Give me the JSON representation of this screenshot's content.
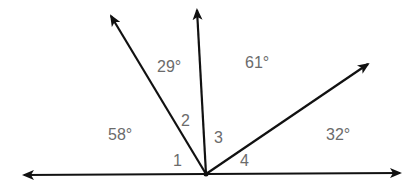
{
  "diagram": {
    "type": "angles-on-a-line",
    "vertex": {
      "x": 206,
      "y": 174
    },
    "rays": [
      {
        "name": "left-ray",
        "tip": {
          "x": 22,
          "y": 175
        }
      },
      {
        "name": "right-ray",
        "tip": {
          "x": 402,
          "y": 173
        }
      },
      {
        "name": "upper-left-ray",
        "tip": {
          "x": 110,
          "y": 14
        }
      },
      {
        "name": "vertical-ray",
        "tip": {
          "x": 197,
          "y": 8
        }
      },
      {
        "name": "upper-right-ray",
        "tip": {
          "x": 370,
          "y": 63
        }
      }
    ],
    "labels": {
      "deg_58": "58°",
      "deg_29": "29°",
      "deg_61": "61°",
      "deg_32": "32°",
      "angle_1": "1",
      "angle_2": "2",
      "angle_3": "3",
      "angle_4": "4"
    }
  }
}
